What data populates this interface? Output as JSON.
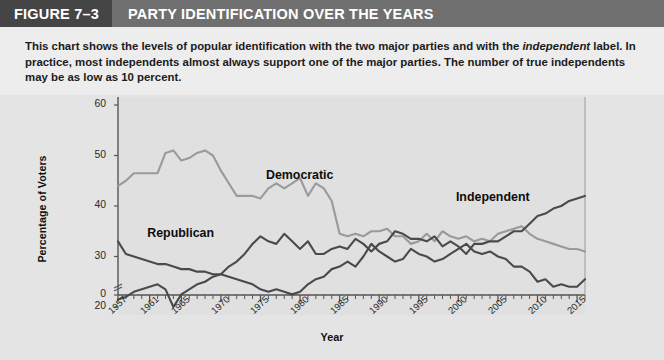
{
  "header": {
    "figure_tag": "FIGURE 7–3",
    "title": "PARTY IDENTIFICATION OVER THE YEARS"
  },
  "caption": {
    "part1": "This chart shows the levels of popular identification with the two major parties and with the ",
    "emphasis": "independent",
    "part2": " label. In practice, most independents almost always support one of the major parties. The number of true independents may be as low as 10 percent."
  },
  "colors": {
    "header_bar": "#6f6f6f",
    "figure_tag_bg": "#454545",
    "panel_bg": "#e4e4e4",
    "caption_bg": "#ededed",
    "democratic": "#9a9a9a",
    "republican": "#4a4a4a",
    "independent": "#4a4a4a",
    "axis": "#555555",
    "gridline": "#f2f2f2"
  },
  "chart_data": {
    "type": "line",
    "title": "PARTY IDENTIFICATION OVER THE YEARS",
    "xlabel": "Year",
    "ylabel": "Percentage of Voters",
    "xlim": [
      1957,
      2016
    ],
    "ylim": [
      0,
      60
    ],
    "y_axis_break": true,
    "y_break_between": [
      0,
      20
    ],
    "grid": true,
    "legend": "inline-labels",
    "yticks": [
      0,
      20,
      30,
      40,
      50,
      60
    ],
    "xticks": [
      1957,
      1961,
      1965,
      1970,
      1975,
      1980,
      1985,
      1990,
      1995,
      2000,
      2005,
      2010,
      2015
    ],
    "x_minor_tick_interval": 1,
    "x": [
      1957,
      1958,
      1959,
      1960,
      1961,
      1962,
      1963,
      1964,
      1965,
      1966,
      1967,
      1968,
      1969,
      1970,
      1971,
      1972,
      1973,
      1974,
      1975,
      1976,
      1977,
      1978,
      1979,
      1980,
      1981,
      1982,
      1983,
      1984,
      1985,
      1986,
      1987,
      1988,
      1989,
      1990,
      1991,
      1992,
      1993,
      1994,
      1995,
      1996,
      1997,
      1998,
      1999,
      2000,
      2001,
      2002,
      2003,
      2004,
      2005,
      2006,
      2007,
      2008,
      2009,
      2010,
      2011,
      2012,
      2013,
      2014,
      2015,
      2016
    ],
    "series": [
      {
        "name": "Democratic",
        "color": "#9a9a9a",
        "label_position": {
          "x": 1981,
          "y": 46
        },
        "values": [
          44,
          45,
          46.5,
          46.5,
          46.5,
          46.5,
          50.5,
          51,
          49,
          49.5,
          50.5,
          51,
          50,
          47,
          44.5,
          42,
          42,
          42,
          41.5,
          43.5,
          44.5,
          43.5,
          44.5,
          45.5,
          42,
          44.5,
          43.5,
          41,
          34.5,
          34,
          34.5,
          34,
          35,
          35,
          35.5,
          34,
          34,
          32.5,
          33,
          34.5,
          33,
          35,
          34,
          33.5,
          34,
          33,
          33.5,
          33,
          34.5,
          35,
          35.5,
          36,
          34.5,
          33.5,
          33,
          32.5,
          32,
          31.5,
          31.5,
          31
        ]
      },
      {
        "name": "Republican",
        "color": "#4a4a4a",
        "label_position": {
          "x": 1966,
          "y": 34.5
        },
        "values": [
          33,
          30.5,
          30,
          29.5,
          29,
          28.5,
          28.5,
          28,
          27.5,
          27.5,
          27,
          27,
          26.5,
          26.5,
          26,
          25.5,
          25,
          24.5,
          23.5,
          23,
          23.5,
          23,
          22.5,
          23,
          24.5,
          25.5,
          26,
          27.5,
          28,
          29,
          28,
          30,
          32.5,
          31,
          30,
          29,
          29.5,
          31.5,
          30.5,
          30,
          29,
          29.5,
          30.5,
          31.5,
          32.5,
          31,
          30.5,
          31,
          30,
          29.5,
          28,
          28,
          27,
          25,
          25.5,
          24,
          24.5,
          24,
          24,
          25.5
        ]
      },
      {
        "name": "Independent",
        "color": "#4a4a4a",
        "label_position": {
          "x": 2005,
          "y": 41.5
        },
        "values": [
          21.5,
          22,
          23,
          23.5,
          24,
          24.5,
          23.5,
          20,
          22.5,
          23.5,
          24.5,
          25,
          26,
          26.5,
          28,
          29,
          30.5,
          32.5,
          34,
          33,
          32.5,
          34.5,
          33,
          31.5,
          33,
          30.5,
          30.5,
          31.5,
          32,
          31.5,
          33.5,
          32.5,
          31,
          32.5,
          33,
          35,
          34.5,
          33.5,
          33.5,
          33,
          34,
          32,
          33,
          32,
          30.5,
          32.5,
          32.5,
          33,
          33,
          34,
          35,
          35,
          36.5,
          38,
          38.5,
          39.5,
          40,
          41,
          41.5,
          42
        ]
      }
    ]
  }
}
